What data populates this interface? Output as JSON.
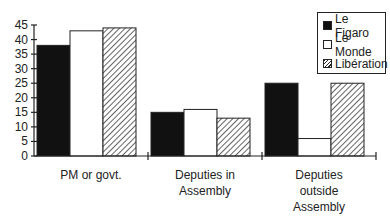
{
  "chart_data": {
    "type": "bar",
    "title": "",
    "xlabel": "",
    "ylabel": "",
    "ylim": [
      0,
      45
    ],
    "yticks": [
      0,
      5,
      10,
      15,
      20,
      25,
      30,
      35,
      40,
      45
    ],
    "grid": false,
    "legend_position": "top-right",
    "categories": [
      [
        "PM or govt."
      ],
      [
        "Deputies in",
        "Assembly"
      ],
      [
        "Deputies",
        "outside",
        "Assembly"
      ]
    ],
    "category_names": [
      "PM or govt.",
      "Deputies in Assembly",
      "Deputies outside Assembly"
    ],
    "series": [
      {
        "name": "Le Figaro",
        "fill": "solid",
        "color": "#111111",
        "values": [
          38,
          15,
          25
        ]
      },
      {
        "name": "Le Monde",
        "fill": "empty",
        "color": "#ffffff",
        "values": [
          43,
          16,
          6
        ]
      },
      {
        "name": "Libération",
        "fill": "hatch",
        "color": "#ffffff",
        "values": [
          44,
          13,
          25
        ]
      }
    ]
  },
  "legend": {
    "items": [
      {
        "label": "Le Figaro"
      },
      {
        "label": "Le Monde"
      },
      {
        "label": "Libération"
      }
    ]
  }
}
